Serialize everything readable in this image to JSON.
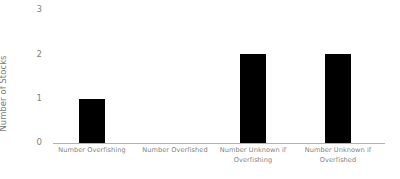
{
  "chart_data": {
    "type": "bar",
    "title": "",
    "xlabel": "",
    "ylabel": "Number of Stocks",
    "categories": [
      "Number Overfishing",
      "Number Overfished",
      "Number Unknown if Overfishing",
      "Number Unknown if Overfished"
    ],
    "values": [
      1,
      0,
      2,
      2
    ],
    "ylim": [
      0,
      3
    ],
    "yticks": [
      "0",
      "1",
      "2",
      "3"
    ],
    "grid": false,
    "legend": "none",
    "bar_color": "#000000",
    "axis_color": "#b2b2b2",
    "text_color": "#7f7f7f"
  }
}
